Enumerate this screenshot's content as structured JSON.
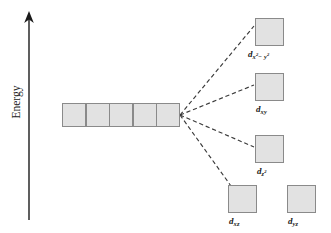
{
  "figure": {
    "type": "energy-level-diagram",
    "background_color": "#ffffff",
    "box_fill_color": "#e2e2e2",
    "box_border_color": "#8a8a8a",
    "line_color": "#3a3a3a",
    "text_color": "#1a1a1a"
  },
  "axis": {
    "label": "Energy",
    "orientation": "vertical",
    "arrow_direction": "up",
    "x": 29,
    "y_top": 13,
    "y_bottom": 220
  },
  "degenerate_set": {
    "name": "free-ion-d-orbitals",
    "cell_count": 5,
    "x": 62,
    "y": 103,
    "cell_width": 24,
    "cell_height": 24,
    "labels": []
  },
  "convergence_point": {
    "x": 180,
    "y": 115
  },
  "split_levels": [
    {
      "id": "dx2-y2",
      "label_main": "d",
      "label_sub": "x",
      "label_sup1": "2",
      "label_sub2": "− y",
      "label_sup2": "2",
      "label_text": "dx2−y2",
      "box_x": 255,
      "box_y": 18,
      "box_w": 29,
      "box_h": 28,
      "label_x": 248,
      "label_y": 49,
      "has_leader_line": true
    },
    {
      "id": "dxy",
      "label_main": "d",
      "label_sub": "xy",
      "label_text": "dxy",
      "box_x": 255,
      "box_y": 73,
      "box_w": 29,
      "box_h": 28,
      "label_x": 256,
      "label_y": 104,
      "has_leader_line": true
    },
    {
      "id": "dz2",
      "label_main": "d",
      "label_sub": "z",
      "label_sup1": "2",
      "label_text": "dz2",
      "box_x": 255,
      "box_y": 135,
      "box_w": 29,
      "box_h": 28,
      "label_x": 257,
      "label_y": 166,
      "has_leader_line": true
    },
    {
      "id": "dxz",
      "label_main": "d",
      "label_sub": "xz",
      "label_text": "dxz",
      "box_x": 228,
      "box_y": 185,
      "box_w": 29,
      "box_h": 28,
      "label_x": 229,
      "label_y": 216,
      "has_leader_line": true
    },
    {
      "id": "dyz",
      "label_main": "d",
      "label_sub": "yz",
      "label_text": "dyz",
      "box_x": 287,
      "box_y": 185,
      "box_w": 29,
      "box_h": 28,
      "label_x": 288,
      "label_y": 216,
      "has_leader_line": false
    }
  ],
  "connector_lines": [
    {
      "to": "dx2-y2",
      "x1": 180,
      "y1": 115,
      "x2": 254,
      "y2": 26,
      "style": "dashed"
    },
    {
      "to": "dxy",
      "x1": 180,
      "y1": 115,
      "x2": 254,
      "y2": 85,
      "style": "dashed"
    },
    {
      "to": "dz2",
      "x1": 180,
      "y1": 115,
      "x2": 254,
      "y2": 147,
      "style": "dashed"
    },
    {
      "to": "dxz",
      "x1": 180,
      "y1": 115,
      "x2": 231,
      "y2": 186,
      "style": "dashed"
    }
  ]
}
